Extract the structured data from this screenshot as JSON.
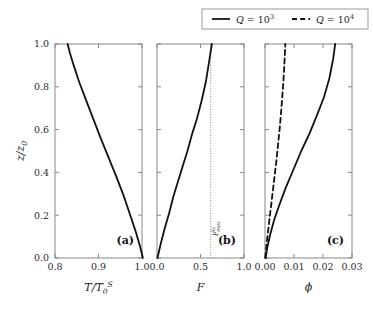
{
  "figure": {
    "background": "#ffffff",
    "line_color": "#111111",
    "axis_color": "#888888",
    "legend": {
      "entries": [
        {
          "label_var": "Q",
          "label_eq": "=",
          "label_base": "10",
          "label_exp": "3",
          "style": "solid"
        },
        {
          "label_var": "Q",
          "label_eq": "=",
          "label_base": "10",
          "label_exp": "4",
          "style": "dashed"
        }
      ],
      "position": "top-right",
      "border": true
    },
    "shared_y": {
      "label_main": "z/z",
      "label_sub": "0",
      "ticks": [
        "0.0",
        "0.2",
        "0.4",
        "0.6",
        "0.8",
        "1.0"
      ],
      "tickvals": [
        0.0,
        0.2,
        0.4,
        0.6,
        0.8,
        1.0
      ],
      "ylim": [
        0.0,
        1.0
      ]
    }
  },
  "chart_data": [
    {
      "type": "line",
      "panel": "(a)",
      "title": "",
      "xlabel_main": "T/T",
      "xlabel_sub": "0",
      "xlabel_sup": "S",
      "ylabel": "z/z0",
      "xlim": [
        0.8,
        1.0
      ],
      "ylim": [
        0.0,
        1.0
      ],
      "xticks": [
        "0.8",
        "0.9",
        "1.0"
      ],
      "xtickvals": [
        0.8,
        0.9,
        1.0
      ],
      "grid": false,
      "series": [
        {
          "name": "Q = 10^3",
          "style": "solid",
          "x": [
            1.002,
            0.996,
            0.986,
            0.973,
            0.958,
            0.941,
            0.923,
            0.905,
            0.888,
            0.871,
            0.856,
            0.843,
            0.834,
            0.829
          ],
          "y": [
            0.0,
            0.05,
            0.12,
            0.2,
            0.29,
            0.38,
            0.47,
            0.56,
            0.65,
            0.74,
            0.82,
            0.9,
            0.96,
            1.0
          ]
        }
      ]
    },
    {
      "type": "line",
      "panel": "(b)",
      "title": "",
      "xlabel_main": "F",
      "ylabel": "z/z0",
      "xlim": [
        0.0,
        1.0
      ],
      "ylim": [
        0.0,
        1.0
      ],
      "xticks": [
        "0.0",
        "0.5",
        "1.0"
      ],
      "xtickvals": [
        0.0,
        0.5,
        1.0
      ],
      "grid": false,
      "annotations": [
        {
          "name": "F-max-lc-line",
          "type": "vline",
          "x": 0.617,
          "style": "dotted",
          "label_main": "F",
          "label_sup": "lc",
          "label_sub": "max"
        }
      ],
      "series": [
        {
          "name": "Q = 10^3",
          "style": "solid",
          "x": [
            0.005,
            0.045,
            0.09,
            0.14,
            0.19,
            0.243,
            0.296,
            0.35,
            0.404,
            0.458,
            0.51,
            0.56,
            0.6,
            0.63
          ],
          "y": [
            0.0,
            0.07,
            0.14,
            0.21,
            0.29,
            0.36,
            0.43,
            0.5,
            0.58,
            0.65,
            0.73,
            0.82,
            0.92,
            1.0
          ]
        }
      ]
    },
    {
      "type": "line",
      "panel": "(c)",
      "title": "",
      "xlabel_main": "ϕ",
      "ylabel": "z/z0",
      "xlim": [
        0.0,
        0.03
      ],
      "ylim": [
        0.0,
        1.0
      ],
      "xticks": [
        "0.00",
        "0.01",
        "0.02",
        "0.03"
      ],
      "xtickvals": [
        0.0,
        0.01,
        0.02,
        0.03
      ],
      "grid": false,
      "series": [
        {
          "name": "Q = 10^3",
          "style": "solid",
          "x": [
            0.0002,
            0.0008,
            0.0018,
            0.0032,
            0.005,
            0.0072,
            0.0097,
            0.0125,
            0.0153,
            0.018,
            0.0203,
            0.0222,
            0.0235,
            0.0242
          ],
          "y": [
            0.0,
            0.05,
            0.11,
            0.18,
            0.25,
            0.33,
            0.41,
            0.5,
            0.58,
            0.67,
            0.75,
            0.84,
            0.93,
            1.0
          ]
        },
        {
          "name": "Q = 10^4",
          "style": "dashed",
          "x": [
            0.0001,
            0.0005,
            0.0011,
            0.0018,
            0.0025,
            0.0032,
            0.0039,
            0.0045,
            0.0051,
            0.0056,
            0.0061,
            0.0065,
            0.0068,
            0.007
          ],
          "y": [
            0.0,
            0.06,
            0.13,
            0.21,
            0.29,
            0.37,
            0.45,
            0.53,
            0.61,
            0.69,
            0.78,
            0.86,
            0.94,
            1.0
          ]
        }
      ]
    }
  ]
}
